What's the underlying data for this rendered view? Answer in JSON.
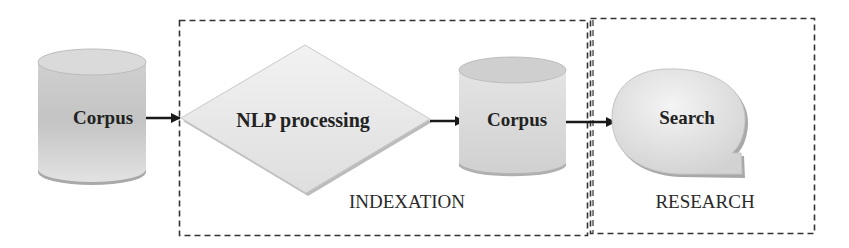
{
  "diagram": {
    "nodes": [
      {
        "id": "corpus-input",
        "label": "Corpus",
        "shape": "cylinder"
      },
      {
        "id": "nlp",
        "label": "NLP processing",
        "shape": "diamond"
      },
      {
        "id": "corpus-indexed",
        "label": "Corpus",
        "shape": "cylinder"
      },
      {
        "id": "search",
        "label": "Search",
        "shape": "speech-bubble"
      }
    ],
    "edges": [
      {
        "from": "corpus-input",
        "to": "nlp"
      },
      {
        "from": "nlp",
        "to": "corpus-indexed"
      },
      {
        "from": "corpus-indexed",
        "to": "search"
      }
    ],
    "groups": [
      {
        "id": "indexation",
        "label": "INDEXATION",
        "members": [
          "nlp",
          "corpus-indexed"
        ]
      },
      {
        "id": "research",
        "label": "RESEARCH",
        "members": [
          "search"
        ]
      }
    ]
  },
  "colors": {
    "shape_fill": "#d9d9d9",
    "shape_shadow": "#b8b8b8",
    "dash": "#333333",
    "arrow": "#1a1a1a"
  }
}
